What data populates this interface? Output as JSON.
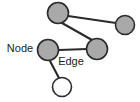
{
  "figure": {
    "name": "node-edge-graph-diagram",
    "background_color": "#ffffff",
    "width": 140,
    "height": 102
  },
  "style": {
    "node_fill": "#a9a9a9",
    "node_fill_empty": "#ffffff",
    "node_stroke": "#2b2b2b",
    "node_stroke_width": 1.6,
    "edge_stroke": "#2b2b2b",
    "edge_stroke_width": 2.1,
    "label_color": "#1c1c1c",
    "label_halo_color": "#ffffff"
  },
  "diagram": {
    "type": "graph",
    "nodes": [
      {
        "id": "n1",
        "name": "node-top-left",
        "cx": 58,
        "cy": 13,
        "r": 10.5,
        "filled": true
      },
      {
        "id": "n2",
        "name": "node-top-right",
        "cx": 125,
        "cy": 25,
        "r": 9.5,
        "filled": true
      },
      {
        "id": "n3",
        "name": "node-middle-left",
        "cx": 48,
        "cy": 50,
        "r": 10.5,
        "filled": true
      },
      {
        "id": "n4",
        "name": "node-middle-right",
        "cx": 97,
        "cy": 49,
        "r": 10.5,
        "filled": true
      },
      {
        "id": "n5",
        "name": "node-bottom",
        "cx": 62,
        "cy": 87,
        "r": 9.5,
        "filled": false
      }
    ],
    "edges": [
      {
        "id": "e1",
        "name": "edge-top-left-to-top-right",
        "from": "n1",
        "to": "n2",
        "x1": 68,
        "y1": 16,
        "x2": 116,
        "y2": 23
      },
      {
        "id": "e2",
        "name": "edge-top-left-to-middle-right",
        "from": "n1",
        "to": "n4",
        "x1": 62,
        "y1": 23,
        "x2": 92,
        "y2": 40
      },
      {
        "id": "e3",
        "name": "edge-middle-left-to-middle-right",
        "from": "n3",
        "to": "n4",
        "x1": 59,
        "y1": 50,
        "x2": 87,
        "y2": 49
      },
      {
        "id": "e4",
        "name": "edge-middle-left-to-bottom",
        "from": "n3",
        "to": "n5",
        "x1": 50,
        "y1": 61,
        "x2": 59,
        "y2": 78
      }
    ],
    "labels": [
      {
        "id": "l1",
        "name": "node-label",
        "text": "Node",
        "x": 20,
        "y": 49,
        "target": "n3"
      },
      {
        "id": "l2",
        "name": "edge-label",
        "text": "Edge",
        "x": 71,
        "y": 62,
        "target": "e3"
      }
    ]
  }
}
